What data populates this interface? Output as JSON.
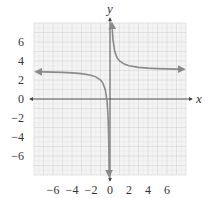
{
  "chart_data": {
    "type": "line",
    "title": "",
    "function": "y = 1/x + 3",
    "xlabel": "x",
    "ylabel": "y",
    "xlim": [
      -8,
      8
    ],
    "ylim": [
      -8,
      8
    ],
    "grid": true,
    "x_ticks": [
      -6,
      -4,
      -2,
      0,
      2,
      4,
      6
    ],
    "y_ticks": [
      6,
      4,
      2,
      0,
      -2,
      -4,
      -6
    ],
    "x_tick_labels": [
      "−6",
      "−4",
      "−2",
      "0",
      "2",
      "4",
      "6"
    ],
    "y_tick_labels": [
      "6",
      "4",
      "2",
      "0",
      "−2",
      "−4",
      "−6"
    ],
    "asymptotes": {
      "vertical": 0,
      "horizontal": 3
    },
    "series": [
      {
        "name": "right-branch",
        "x": [
          0.2,
          0.3,
          0.5,
          0.75,
          1,
          1.5,
          2,
          3,
          4,
          5,
          6,
          7,
          7.8
        ],
        "y": [
          8,
          6.33,
          5,
          4.33,
          4,
          3.67,
          3.5,
          3.33,
          3.25,
          3.2,
          3.17,
          3.14,
          3.13
        ]
      },
      {
        "name": "left-branch",
        "x": [
          -7.8,
          -7,
          -6,
          -5,
          -4,
          -3,
          -2,
          -1.5,
          -1,
          -0.75,
          -0.5,
          -0.3,
          -0.2,
          -0.15,
          -0.11,
          -0.09
        ],
        "y": [
          2.87,
          2.86,
          2.83,
          2.8,
          2.75,
          2.67,
          2.5,
          2.33,
          2,
          1.67,
          1,
          -0.33,
          -2,
          -3.67,
          -6.09,
          -8.11
        ]
      }
    ],
    "colors": {
      "curve": "#8a8a8a",
      "axis": "#6e6e6e",
      "grid_major": "#d4d4d4",
      "grid_minor": "#e8e8e8",
      "grid_bg": "#f4f4f4",
      "text": "#333333"
    }
  }
}
